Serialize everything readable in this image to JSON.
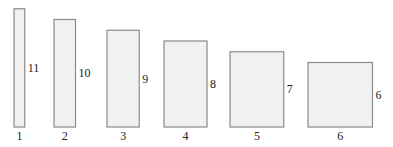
{
  "diagram": {
    "rectangles": [
      {
        "width": 1,
        "height": 11,
        "width_label": "1",
        "height_label": "11"
      },
      {
        "width": 2,
        "height": 10,
        "width_label": "2",
        "height_label": "10"
      },
      {
        "width": 3,
        "height": 9,
        "width_label": "3",
        "height_label": "9"
      },
      {
        "width": 4,
        "height": 8,
        "width_label": "4",
        "height_label": "8"
      },
      {
        "width": 5,
        "height": 7,
        "width_label": "5",
        "height_label": "7"
      },
      {
        "width": 6,
        "height": 6,
        "width_label": "6",
        "height_label": "6"
      }
    ],
    "colors": {
      "fill": "#f1f1f1",
      "stroke": "#8a8a8a",
      "text": "#222222"
    }
  }
}
